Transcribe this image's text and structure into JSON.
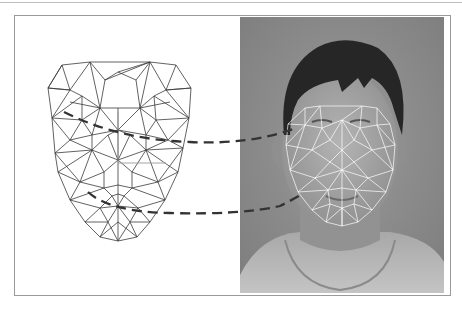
{
  "figure": {
    "panels": [
      {
        "id": "wireframe",
        "label": "3D face mesh model"
      },
      {
        "id": "photo",
        "label": "Face photograph with fitted mesh overlay"
      }
    ],
    "connectors": [
      {
        "id": "upper",
        "from": "mesh-eye-region",
        "to": "photo-eye-region",
        "style": "dashed"
      },
      {
        "id": "lower",
        "from": "mesh-mouth-region",
        "to": "photo-mouth-region",
        "style": "dashed"
      }
    ],
    "colors": {
      "frame_border": "#9a9a9a",
      "mesh_line": "#3a3a3a",
      "mesh_axis": "#9a9a9a",
      "connector": "#333333",
      "photo_background": "#8c8c8c",
      "hair": "#2a2a2a",
      "skin": "#a6a6a6",
      "shirt": "#b8b8b8",
      "overlay_mesh": "#ffffff"
    }
  }
}
